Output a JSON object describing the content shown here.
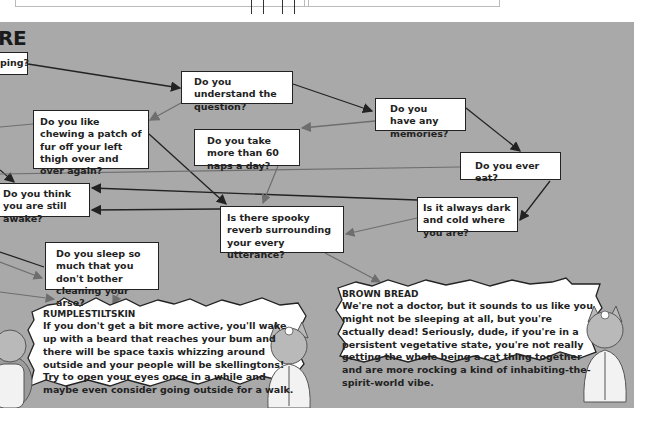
{
  "header_fragment": {
    "title": "RE"
  },
  "boxes": {
    "sleeping": "ping?",
    "understand": "Do you understand the question?",
    "memories": "Do you have any memories?",
    "chewing": "Do you like chewing a patch of fur off your left thigh over and over again?",
    "naps": "Do you take more than 60 naps a day?",
    "eat": "Do you ever eat?",
    "awake": "Do you think you are still awake?",
    "dark": "Is it always dark and cold where you are?",
    "reverb": "Is there spooky reverb surrounding your every utterance?",
    "cleaning": "Do you sleep so much that you don't bother cleaning your arse?"
  },
  "results": {
    "rumplestiltskin": {
      "title": "RUMPLESTILTSKIN",
      "body": "If you don't get a bit more active, you'll wake up with a beard that reaches your bum and there will be space taxis whizzing around outside and your people will be skellingtons! Try to open your eyes once in a while and maybe even consider going outside for a walk."
    },
    "brown_bread": {
      "title": "BROWN BREAD",
      "body": "We're not a doctor, but it sounds to us like you might not be sleeping at all, but you're actually dead! Seriously, dude, if you're in a persistent vegetative state, you're not really getting the whole being a cat thing together and are more rocking a kind of inhabiting-the-spirit-world vibe."
    }
  },
  "colors": {
    "panel_bg": "#a9a9a9",
    "box_bg": "#ffffff",
    "arrow_dark": "#222222",
    "arrow_gray": "#6e6e6e"
  },
  "icons": [
    "cat-doctor-illustration"
  ]
}
